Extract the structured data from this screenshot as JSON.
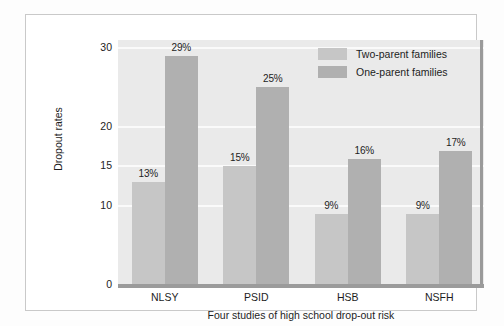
{
  "chart_data": {
    "type": "bar",
    "title": "",
    "xlabel": "Four studies of high school drop-out risk",
    "ylabel": "Dropout rates",
    "categories": [
      "NLSY",
      "PSID",
      "HSB",
      "NSFH"
    ],
    "yticks": [
      0,
      10,
      15,
      20,
      30
    ],
    "ylim": [
      0,
      31
    ],
    "grid": true,
    "legend_position": "top-right",
    "series": [
      {
        "name": "Two-parent families",
        "color": "#c6c6c6",
        "values": [
          13,
          15,
          9,
          9
        ],
        "labels": [
          "13%",
          "15%",
          "9%",
          "9%"
        ]
      },
      {
        "name": "One-parent families",
        "color": "#b0b0b0",
        "values": [
          29,
          25,
          16,
          17
        ],
        "labels": [
          "29%",
          "25%",
          "16%",
          "17%"
        ]
      }
    ]
  },
  "axis": {
    "ytick_labels": [
      "30",
      "20",
      "15",
      "10",
      "0"
    ],
    "y_axis_title": "Dropout rates",
    "x_axis_title": "Four studies of high school drop-out risk",
    "xtick_labels": [
      "NLSY",
      "PSID",
      "HSB",
      "NSFH"
    ]
  },
  "legend": {
    "entries": [
      {
        "label": "Two-parent families",
        "color": "#c6c6c6"
      },
      {
        "label": "One-parent families",
        "color": "#b0b0b0"
      }
    ]
  },
  "bar_labels": {
    "nlsy_two": "13%",
    "nlsy_one": "29%",
    "psid_two": "15%",
    "psid_one": "25%",
    "hsb_two": "9%",
    "hsb_one": "16%",
    "nsfh_two": "9%",
    "nsfh_one": "17%"
  }
}
